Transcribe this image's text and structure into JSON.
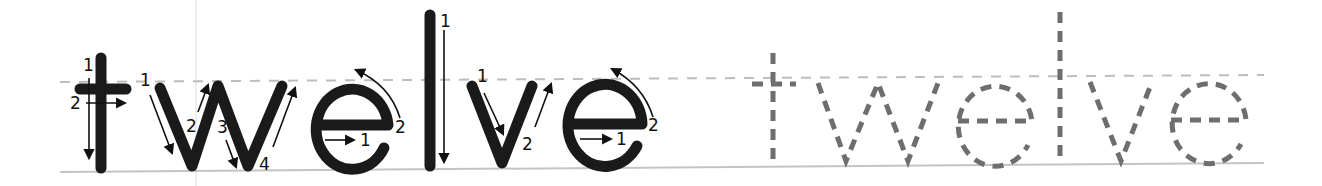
{
  "worksheet": {
    "word": "twelve",
    "traced_letters": [
      "t",
      "w",
      "e",
      "l",
      "v",
      "e"
    ],
    "stroke_numbers": {
      "t": [
        "1",
        "2"
      ],
      "w": [
        "1",
        "2",
        "3",
        "4"
      ],
      "e1": [
        "1",
        "2"
      ],
      "l": [
        "1"
      ],
      "v": [
        "1",
        "2"
      ],
      "e2": [
        "1",
        "2"
      ]
    },
    "colors": {
      "solid_letter": "#1a1a1a",
      "dashed_letter": "#6e6e6e",
      "midline": "#bdbdbd",
      "baseline": "#c4c4c4",
      "arrow": "#111111"
    }
  }
}
